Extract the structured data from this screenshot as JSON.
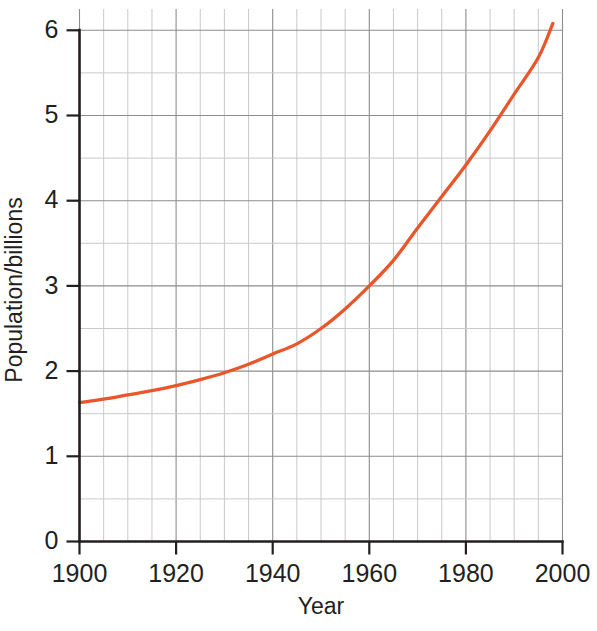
{
  "chart_data": {
    "type": "line",
    "title": "",
    "xlabel": "Year",
    "ylabel": "Population/billions",
    "xlim": [
      1900,
      2000
    ],
    "ylim": [
      0,
      6.25
    ],
    "grid": true,
    "legend": null,
    "x_ticks": [
      1900,
      1920,
      1940,
      1960,
      1980,
      2000
    ],
    "x_tick_labels": [
      "1900",
      "1920",
      "1940",
      "1960",
      "1980",
      "2000"
    ],
    "x_minor_step": 10,
    "y_ticks": [
      0,
      1,
      2,
      3,
      4,
      5,
      6
    ],
    "y_tick_labels": [
      "0",
      "1",
      "2",
      "3",
      "4",
      "5",
      "6"
    ],
    "y_minor_step": 0.5,
    "series": [
      {
        "name": "World population",
        "color": "#e8562a",
        "x": [
          1900,
          1905,
          1910,
          1915,
          1920,
          1925,
          1930,
          1935,
          1940,
          1945,
          1950,
          1955,
          1960,
          1965,
          1970,
          1975,
          1980,
          1985,
          1990,
          1995,
          1998
        ],
        "values": [
          1.63,
          1.67,
          1.72,
          1.77,
          1.83,
          1.9,
          1.98,
          2.08,
          2.2,
          2.32,
          2.5,
          2.73,
          3.0,
          3.3,
          3.68,
          4.05,
          4.42,
          4.82,
          5.25,
          5.68,
          6.08
        ]
      }
    ]
  },
  "axis_labels": {
    "x_title": "Year",
    "y_title": "Population/billions"
  },
  "colors": {
    "line": "#e8562a",
    "axis": "#231f20",
    "grid_major": "#8d8d90",
    "grid_minor": "#c9c9cc",
    "background": "#ffffff"
  }
}
